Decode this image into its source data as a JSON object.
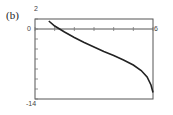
{
  "panel_label": "(b)",
  "axes": {
    "y_top_label": "2",
    "y_zero_label": "0",
    "y_bottom_label": "-14",
    "x_right_label": "6"
  },
  "chart_data": {
    "type": "line",
    "title": "",
    "xlabel": "",
    "ylabel": "",
    "xlim": [
      0,
      6
    ],
    "ylim": [
      -14,
      2
    ],
    "grid": false,
    "x_ticks": [
      0,
      1,
      2,
      3,
      4,
      5,
      6
    ],
    "y_ticks": [
      2,
      0,
      -2,
      -4,
      -6,
      -8,
      -10,
      -12,
      -14
    ],
    "series": [
      {
        "name": "curve",
        "x": [
          0.7,
          1.0,
          1.25,
          1.5,
          2.0,
          2.5,
          3.0,
          3.5,
          4.0,
          4.5,
          5.0,
          5.4,
          5.7,
          5.9,
          6.0
        ],
        "y": [
          1.6,
          0.6,
          0.0,
          -0.6,
          -1.7,
          -2.7,
          -3.6,
          -4.5,
          -5.3,
          -6.2,
          -7.2,
          -8.3,
          -9.6,
          -11.2,
          -12.7
        ]
      }
    ]
  }
}
